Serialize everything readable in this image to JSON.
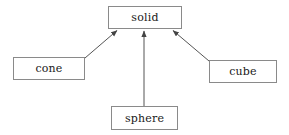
{
  "diagram": {
    "type": "class-inheritance",
    "background_color": "#ffffff",
    "edge_color": "#555555",
    "border_color": "#8a8a8a",
    "text_color": "#1a1a1a",
    "nodes": [
      {
        "id": "solid",
        "label": "solid",
        "x": 108,
        "y": 6,
        "width": 74,
        "height": 23
      },
      {
        "id": "cone",
        "label": "cone",
        "x": 13,
        "y": 57,
        "width": 72,
        "height": 23
      },
      {
        "id": "cube",
        "label": "cube",
        "x": 209,
        "y": 60,
        "width": 68,
        "height": 23
      },
      {
        "id": "sphere",
        "label": "sphere",
        "x": 111,
        "y": 106,
        "width": 67,
        "height": 24
      }
    ],
    "edges": [
      {
        "id": "cone-to-solid",
        "from": "cone",
        "to": "solid",
        "x1": 85,
        "y1": 58,
        "x2": 118,
        "y2": 30,
        "arrow": "end"
      },
      {
        "id": "sphere-to-solid",
        "from": "sphere",
        "to": "solid",
        "x1": 144,
        "y1": 106,
        "x2": 144,
        "y2": 30,
        "arrow": "end"
      },
      {
        "id": "cube-to-solid",
        "from": "cube",
        "to": "solid",
        "x1": 209,
        "y1": 61,
        "x2": 172,
        "y2": 30,
        "arrow": "end"
      }
    ]
  }
}
